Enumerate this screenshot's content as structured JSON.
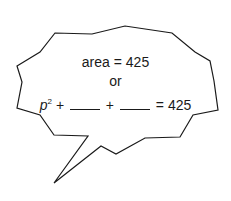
{
  "bubble": {
    "line1": "area = 425",
    "line2": "or",
    "line3": {
      "var": "p",
      "exp": "2",
      "plus1": "+",
      "plus2": "+",
      "rhs": "= 425"
    }
  },
  "colors": {
    "stroke": "#1a1a1a",
    "fill": "#ffffff"
  }
}
